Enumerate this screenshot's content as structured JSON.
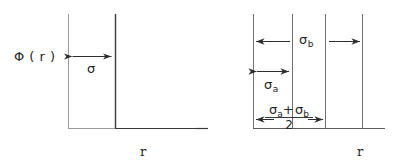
{
  "figure": {
    "background_color": "#ffffff",
    "line_color_axis": "#8c8c8c",
    "line_color_curve": "#3a3a3a",
    "width": 397,
    "height": 164
  },
  "panels": [
    {
      "id": "left-panel",
      "name": "hard-sphere-potential",
      "y_axis_label": "Φ ( r )",
      "x_axis_label": "r",
      "dimension_labels": [
        {
          "id": "sigma",
          "text": "σ",
          "sub": ""
        }
      ],
      "geometry": {
        "y_axis_x": 68,
        "wall_x": 115,
        "top_y": 14,
        "baseline_y": 128,
        "baseline_x_end": 196,
        "arrow_y": 56
      }
    },
    {
      "id": "right-panel",
      "name": "additive-hard-sphere-mixture-potential",
      "x_axis_label": "r",
      "dimension_labels": [
        {
          "id": "sigma-b",
          "text": "σ",
          "sub": "b"
        },
        {
          "id": "sigma-a",
          "text": "σ",
          "sub": "a"
        }
      ],
      "fraction_label": {
        "id": "sigma-a-plus-sigma-b-over-2",
        "numerator_left_sym": "σ",
        "numerator_left_sub": "a",
        "numerator_operator": "+",
        "numerator_right_sym": "σ",
        "numerator_right_sub": "b",
        "denominator": "2"
      },
      "geometry": {
        "line_x_positions": [
          253,
          292,
          325,
          362
        ],
        "top_y": 14,
        "baseline_y": 128,
        "baseline_x_start": 253,
        "baseline_x_end": 385,
        "arrow_y_top": 41,
        "arrow_y_mid": 71,
        "arrow_y_bottom": 119
      }
    }
  ]
}
